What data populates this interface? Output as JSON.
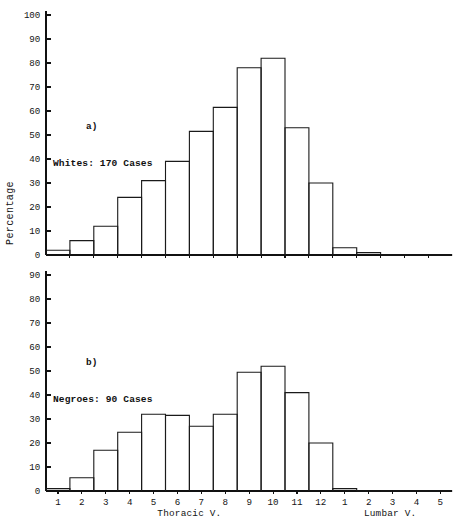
{
  "figure": {
    "y_axis_title": "Percentage",
    "x_axis_title_thoracic": "Thoracic V.",
    "x_axis_title_lumbar": "Lumbar V."
  },
  "chart_data": [
    {
      "type": "bar",
      "panel": "a)",
      "title": "Whites: 170 Cases",
      "xlabel": "Thoracic V. / Lumbar V.",
      "ylabel": "Percentage",
      "ylim": [
        0,
        100
      ],
      "ytick_labels": [
        "0",
        "10",
        "20",
        "30",
        "40",
        "50",
        "60",
        "70",
        "80",
        "90",
        "100"
      ],
      "yticks": [
        0,
        10,
        20,
        30,
        40,
        50,
        60,
        70,
        80,
        90,
        100
      ],
      "grid": false,
      "legend": "none",
      "categories": [
        "1",
        "2",
        "3",
        "4",
        "5",
        "6",
        "7",
        "8",
        "9",
        "10",
        "11",
        "12",
        "1",
        "2",
        "3",
        "4",
        "5"
      ],
      "category_groups": [
        "Thoracic",
        "Thoracic",
        "Thoracic",
        "Thoracic",
        "Thoracic",
        "Thoracic",
        "Thoracic",
        "Thoracic",
        "Thoracic",
        "Thoracic",
        "Thoracic",
        "Thoracic",
        "Lumbar",
        "Lumbar",
        "Lumbar",
        "Lumbar",
        "Lumbar"
      ],
      "values": [
        2,
        6,
        12,
        24,
        31,
        39,
        51.5,
        61.5,
        78,
        82,
        53,
        30,
        3,
        1,
        0,
        0,
        0
      ]
    },
    {
      "type": "bar",
      "panel": "b)",
      "title": "Negroes: 90 Cases",
      "xlabel": "Thoracic V. / Lumbar V.",
      "ylabel": "Percentage",
      "ylim": [
        0,
        100
      ],
      "ytick_labels": [
        "0",
        "10",
        "20",
        "30",
        "40",
        "50",
        "60",
        "70",
        "80",
        "90"
      ],
      "yticks": [
        0,
        10,
        20,
        30,
        40,
        50,
        60,
        70,
        80,
        90
      ],
      "grid": false,
      "legend": "none",
      "categories": [
        "1",
        "2",
        "3",
        "4",
        "5",
        "6",
        "7",
        "8",
        "9",
        "10",
        "11",
        "12",
        "1",
        "2",
        "3",
        "4",
        "5"
      ],
      "category_groups": [
        "Thoracic",
        "Thoracic",
        "Thoracic",
        "Thoracic",
        "Thoracic",
        "Thoracic",
        "Thoracic",
        "Thoracic",
        "Thoracic",
        "Thoracic",
        "Thoracic",
        "Thoracic",
        "Lumbar",
        "Lumbar",
        "Lumbar",
        "Lumbar",
        "Lumbar"
      ],
      "values": [
        1,
        5.5,
        17,
        24.5,
        32,
        31.5,
        27,
        32,
        49.5,
        52,
        41,
        20,
        1,
        0,
        0,
        0,
        0
      ]
    }
  ],
  "colors": {
    "ink": "#111111",
    "background": "#ffffff"
  }
}
